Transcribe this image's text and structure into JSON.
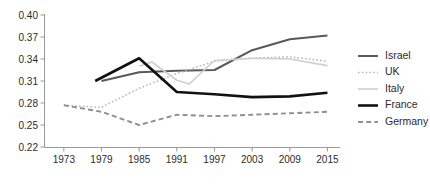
{
  "chart_data": {
    "type": "line",
    "title": "",
    "subtitle": "",
    "xlabel": "",
    "ylabel": "",
    "x": [
      1973,
      1979,
      1985,
      1991,
      1997,
      2003,
      2009,
      2015
    ],
    "xlim": [
      1970,
      2017
    ],
    "ylim": [
      0.22,
      0.4
    ],
    "grid": false,
    "legend_position": "right",
    "xticks": [
      "1973",
      "1979",
      "1985",
      "1991",
      "1997",
      "2003",
      "2009",
      "2015"
    ],
    "yticks": [
      "0.40",
      "0.37",
      "0.34",
      "0.31",
      "0.28",
      "0.25",
      "0.22"
    ],
    "ytick_values": [
      0.4,
      0.37,
      0.34,
      0.31,
      0.28,
      0.25,
      0.22
    ],
    "series": [
      {
        "name": "Israel",
        "color": "#59595b",
        "width": 2.0,
        "dash": "none",
        "x": [
          1979,
          1985,
          1991,
          1997,
          2003,
          2009,
          2015
        ],
        "values": [
          0.31,
          0.322,
          0.324,
          0.325,
          0.352,
          0.367,
          0.372
        ]
      },
      {
        "name": "UK",
        "color": "#b9b9b9",
        "width": 1.6,
        "dash": "dotted",
        "x": [
          1973,
          1979,
          1985,
          1991,
          1997,
          2003,
          2009,
          2015
        ],
        "values": [
          0.277,
          0.274,
          0.3,
          0.32,
          0.337,
          0.341,
          0.343,
          0.337
        ]
      },
      {
        "name": "Italy",
        "color": "#cfcfcf",
        "width": 1.6,
        "dash": "none",
        "x": [
          1985,
          1987,
          1991,
          1993,
          1997,
          2003,
          2009,
          2015
        ],
        "values": [
          0.33,
          0.336,
          0.311,
          0.306,
          0.338,
          0.341,
          0.34,
          0.331
        ]
      },
      {
        "name": "France",
        "color": "#111111",
        "width": 2.6,
        "dash": "none",
        "x": [
          1978,
          1985,
          1991,
          1997,
          2003,
          2009,
          2015
        ],
        "values": [
          0.31,
          0.341,
          0.295,
          0.292,
          0.288,
          0.289,
          0.294
        ]
      },
      {
        "name": "Germany",
        "color": "#8f8f8f",
        "width": 1.9,
        "dash": "dashed",
        "x": [
          1973,
          1979,
          1985,
          1991,
          1997,
          2003,
          2009,
          2015
        ],
        "values": [
          0.277,
          0.268,
          0.25,
          0.264,
          0.262,
          0.264,
          0.266,
          0.268
        ]
      }
    ]
  },
  "axis": {
    "line_color": "#9a9a9a",
    "tick_color": "#9a9a9a"
  },
  "legend": {
    "items": [
      {
        "label": "Israel",
        "color": "#59595b",
        "dash": "none",
        "width": 2.0
      },
      {
        "label": "UK",
        "color": "#b9b9b9",
        "dash": "dotted",
        "width": 1.6
      },
      {
        "label": "Italy",
        "color": "#cfcfcf",
        "dash": "none",
        "width": 1.6
      },
      {
        "label": "France",
        "color": "#111111",
        "dash": "none",
        "width": 2.6
      },
      {
        "label": "Germany",
        "color": "#8f8f8f",
        "dash": "dashed",
        "width": 1.9
      }
    ]
  }
}
